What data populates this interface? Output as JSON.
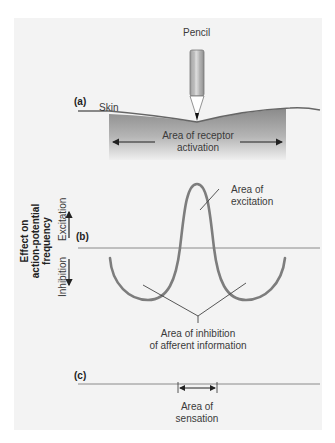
{
  "figure": {
    "pencil_label": "Pencil",
    "panel_a": {
      "label": "(a)",
      "skin_label": "Skin",
      "receptor_label_line1": "Area of receptor",
      "receptor_label_line2": "activation"
    },
    "panel_b": {
      "label": "(b)",
      "y_axis_title_line1": "Effect on",
      "y_axis_title_line2": "action-potential",
      "y_axis_title_line3": "frequency",
      "excitation_axis_label": "Excitation",
      "inhibition_axis_label": "Inhibition",
      "excitation_callout_line1": "Area of",
      "excitation_callout_line2": "excitation",
      "inhibition_callout_line1": "Area of inhibition",
      "inhibition_callout_line2": "of afferent information"
    },
    "panel_c": {
      "label": "(c)",
      "sensation_line1": "Area of",
      "sensation_line2": "sensation"
    }
  },
  "colors": {
    "panel_bg": "#f3f3f3",
    "curve": "#7d7d7d",
    "shade_top": "#8a8a8a",
    "shade_bottom": "#f0f0f0"
  }
}
